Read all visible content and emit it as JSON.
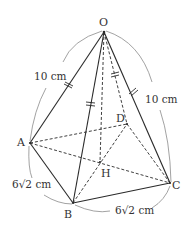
{
  "diagram": {
    "type": "square pyramid",
    "colors": {
      "line": "#2a2a2a",
      "arc": "#888888",
      "text": "#333333"
    },
    "vertices": {
      "O": {
        "label": "O",
        "x": 104,
        "y": 32
      },
      "A": {
        "label": "A",
        "x": 30,
        "y": 143
      },
      "B": {
        "label": "B",
        "x": 73,
        "y": 203
      },
      "C": {
        "label": "C",
        "x": 170,
        "y": 183
      },
      "D": {
        "label": "D",
        "x": 127,
        "y": 124
      },
      "H": {
        "label": "H",
        "x": 100,
        "y": 162
      }
    },
    "solid_edges": [
      "OA",
      "OB",
      "OC",
      "AB",
      "BC"
    ],
    "dashed_edges": [
      "OD",
      "OH",
      "AD",
      "AC",
      "BD",
      "DC"
    ],
    "equal_marks": [
      "OA",
      "OB",
      "OC",
      "OD"
    ],
    "measurements": {
      "OA": "10 cm",
      "OC": "10 cm",
      "AB": "6√2 cm",
      "BC": "6√2 cm"
    }
  }
}
